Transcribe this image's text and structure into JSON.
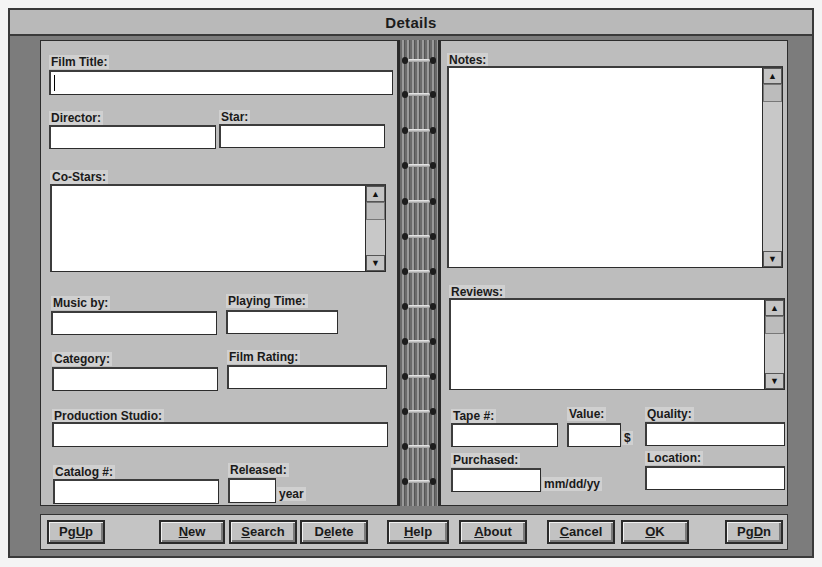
{
  "window": {
    "title": "Details"
  },
  "left_page": {
    "film_title": {
      "label": "Film Title:",
      "value": ""
    },
    "director": {
      "label": "Director:",
      "value": ""
    },
    "star": {
      "label": "Star:",
      "value": ""
    },
    "co_stars": {
      "label": "Co-Stars:",
      "value": ""
    },
    "music_by": {
      "label": "Music by:",
      "value": ""
    },
    "playing_time": {
      "label": "Playing Time:",
      "value": ""
    },
    "category": {
      "label": "Category:",
      "value": ""
    },
    "film_rating": {
      "label": "Film Rating:",
      "value": ""
    },
    "production_studio": {
      "label": "Production Studio:",
      "value": ""
    },
    "catalog": {
      "label": "Catalog #:",
      "value": ""
    },
    "released": {
      "label": "Released:",
      "value": "",
      "suffix": "year"
    }
  },
  "right_page": {
    "notes": {
      "label": "Notes:",
      "value": ""
    },
    "reviews": {
      "label": "Reviews:",
      "value": ""
    },
    "tape": {
      "label": "Tape #:",
      "value": ""
    },
    "value": {
      "label": "Value:",
      "value": "",
      "suffix": "$"
    },
    "quality": {
      "label": "Quality:",
      "value": ""
    },
    "purchased": {
      "label": "Purchased:",
      "value": "",
      "suffix": "mm/dd/yy"
    },
    "location": {
      "label": "Location:",
      "value": ""
    }
  },
  "scroll_icons": {
    "up": "▲",
    "down": "▼"
  },
  "buttons": [
    {
      "id": "pgup",
      "pre": "Pg",
      "u": "U",
      "post": "p"
    },
    {
      "id": "new",
      "pre": "",
      "u": "N",
      "post": "ew"
    },
    {
      "id": "search",
      "pre": "",
      "u": "S",
      "post": "earch"
    },
    {
      "id": "delete",
      "pre": "D",
      "u": "e",
      "post": "lete"
    },
    {
      "id": "help",
      "pre": "",
      "u": "H",
      "post": "elp"
    },
    {
      "id": "about",
      "pre": "",
      "u": "A",
      "post": "bout"
    },
    {
      "id": "cancel",
      "pre": "",
      "u": "C",
      "post": "ancel"
    },
    {
      "id": "ok",
      "pre": "",
      "u": "O",
      "post": "K"
    },
    {
      "id": "pgdn",
      "pre": "Pg",
      "u": "D",
      "post": "n"
    }
  ],
  "colors": {
    "frame": "#7c7c7c",
    "page": "#bdbdbd",
    "field": "#ffffff",
    "title_bar": "#b9b9b9"
  }
}
